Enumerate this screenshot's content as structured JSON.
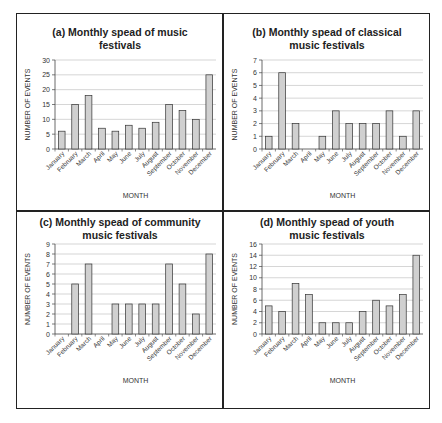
{
  "figure": {
    "panels": [
      {
        "id": "a",
        "title_line1": "(a) Monthly spead of music",
        "title_line2": "festivals"
      },
      {
        "id": "b",
        "title_line1": "(b) Monthly spead of classical",
        "title_line2": "music festivals"
      },
      {
        "id": "c",
        "title_line1": "(c) Monthly spead of community",
        "title_line2": "music festivals"
      },
      {
        "id": "d",
        "title_line1": "(d) Monthly spead of youth",
        "title_line2": "music festivals"
      }
    ],
    "bar_color": "#d0d0d0",
    "bar_stroke": "#333333",
    "grid_color": "#bbbbbb"
  },
  "chart_data": [
    {
      "type": "bar",
      "title": "(a) Monthly spead of music festivals",
      "xlabel": "MONTH",
      "ylabel": "NUMBER OF EVENTS",
      "categories": [
        "January",
        "February",
        "March",
        "April",
        "May",
        "June",
        "July",
        "August",
        "September",
        "October",
        "November",
        "December"
      ],
      "values": [
        6,
        15,
        18,
        7,
        6,
        8,
        7,
        9,
        15,
        13,
        10,
        25
      ],
      "ylim": [
        0,
        30
      ],
      "yticks": [
        0,
        5,
        10,
        15,
        20,
        25,
        30
      ],
      "grid": true,
      "legend": null
    },
    {
      "type": "bar",
      "title": "(b) Monthly spead of classical music festivals",
      "xlabel": "MONTH",
      "ylabel": "NUMBER OF EVENTS",
      "categories": [
        "January",
        "February",
        "March",
        "April",
        "May",
        "June",
        "July",
        "August",
        "September",
        "October",
        "November",
        "December"
      ],
      "values": [
        1,
        6,
        2,
        0,
        1,
        3,
        2,
        2,
        2,
        3,
        1,
        3
      ],
      "ylim": [
        0,
        7
      ],
      "yticks": [
        0,
        1,
        2,
        3,
        4,
        5,
        6,
        7
      ],
      "grid": true,
      "legend": null
    },
    {
      "type": "bar",
      "title": "(c) Monthly spead of community music festivals",
      "xlabel": "MONTH",
      "ylabel": "NUMBER OF EVENTS",
      "categories": [
        "January",
        "February",
        "March",
        "April",
        "May",
        "June",
        "July",
        "August",
        "September",
        "October",
        "November",
        "December"
      ],
      "values": [
        0,
        5,
        7,
        0,
        3,
        3,
        3,
        3,
        7,
        5,
        2,
        8
      ],
      "ylim": [
        0,
        9
      ],
      "yticks": [
        0,
        1,
        2,
        3,
        4,
        5,
        6,
        7,
        8,
        9
      ],
      "grid": true,
      "legend": null
    },
    {
      "type": "bar",
      "title": "(d) Monthly spead of youth music festivals",
      "xlabel": "MONTH",
      "ylabel": "NUMBER OF EVENTS",
      "categories": [
        "January",
        "February",
        "March",
        "April",
        "May",
        "June",
        "July",
        "August",
        "September",
        "October",
        "November",
        "December"
      ],
      "values": [
        5,
        4,
        9,
        7,
        2,
        2,
        2,
        4,
        6,
        5,
        7,
        14
      ],
      "ylim": [
        0,
        16
      ],
      "yticks": [
        0,
        2,
        4,
        6,
        8,
        10,
        12,
        14,
        16
      ],
      "grid": true,
      "legend": null
    }
  ]
}
